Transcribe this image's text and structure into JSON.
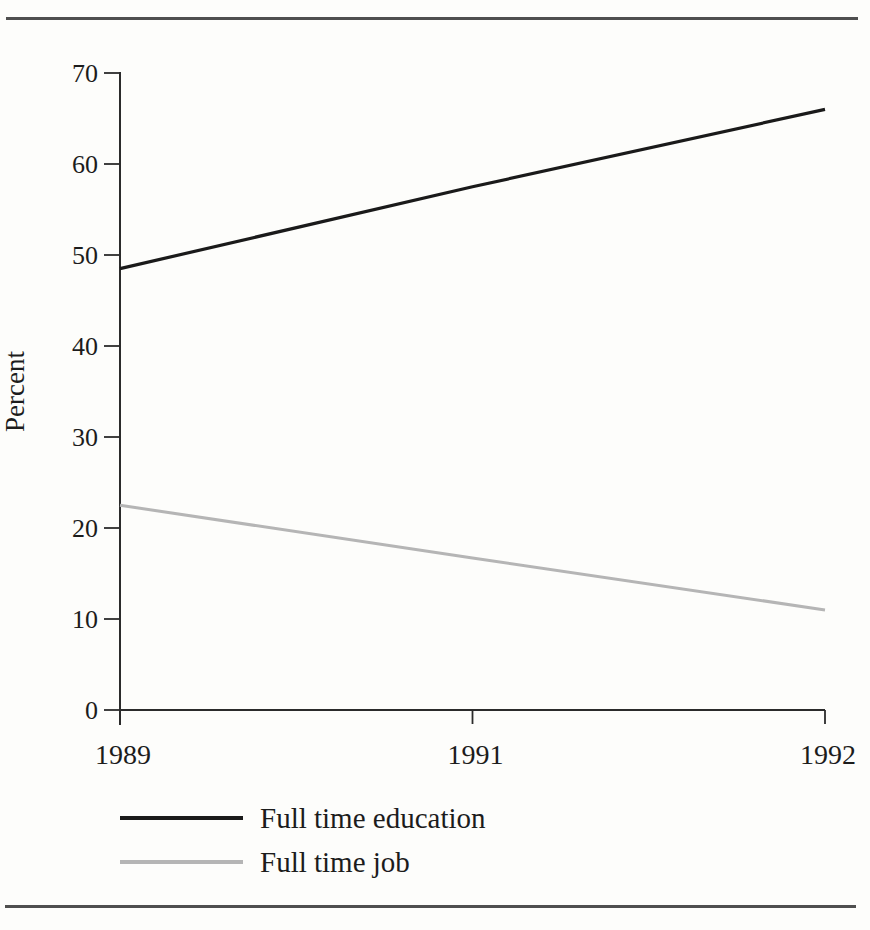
{
  "page": {
    "background_color": "#fdfdfb",
    "rule_color": "#4f4f4f"
  },
  "chart_data": {
    "type": "line",
    "title": "",
    "xlabel": "",
    "ylabel": "Percent",
    "categories": [
      "1989",
      "1991",
      "1992"
    ],
    "series": [
      {
        "name": "Full time education",
        "values": [
          48.5,
          57.5,
          66
        ],
        "color": "#1a1a1a",
        "stroke_width": 3.2
      },
      {
        "name": "Full time job",
        "values": [
          22.5,
          16.7,
          11
        ],
        "color": "#b5b5b5",
        "stroke_width": 3
      }
    ],
    "ylim": [
      0,
      70
    ],
    "yticks": [
      0,
      10,
      20,
      30,
      40,
      50,
      60,
      70
    ],
    "grid": false,
    "legend_position": "below-left"
  }
}
